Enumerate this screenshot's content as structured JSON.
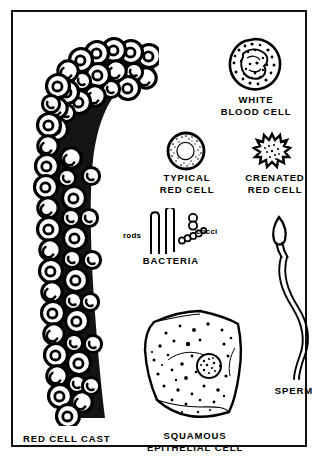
{
  "plate": {
    "title": "Urine sediment microscopy elements",
    "background_color": "#ffffff",
    "ink_color": "#000000",
    "frame_color": "#111111",
    "style": "black-and-white line drawing"
  },
  "specimens": [
    {
      "id": "red-cell-cast",
      "caption": "RED CELL CAST",
      "icon": "red-cell-cast-illustration",
      "position": "left column, full height, curving from upper right to lower left"
    },
    {
      "id": "white-blood-cell",
      "caption": "WHITE\nBLOOD CELL",
      "caption_lines": [
        "WHITE",
        "BLOOD CELL"
      ],
      "icon": "white-blood-cell-illustration",
      "position": "upper right"
    },
    {
      "id": "typical-red-cell",
      "caption": "TYPICAL\nRED CELL",
      "caption_lines": [
        "TYPICAL",
        "RED CELL"
      ],
      "icon": "typical-red-cell-illustration",
      "position": "middle center"
    },
    {
      "id": "crenated-red-cell",
      "caption": "CRENATED\nRED CELL",
      "caption_lines": [
        "CRENATED",
        "RED CELL"
      ],
      "icon": "crenated-red-cell-illustration",
      "position": "middle right"
    },
    {
      "id": "bacteria",
      "caption": "BACTERIA",
      "icon": "bacteria-illustration",
      "position": "center",
      "sub_labels": [
        {
          "id": "rods",
          "text": "rods"
        },
        {
          "id": "cocci",
          "text": "cocci"
        }
      ]
    },
    {
      "id": "sperm",
      "caption": "SPERM",
      "icon": "sperm-illustration",
      "position": "lower right"
    },
    {
      "id": "squamous-epithelial-cell",
      "caption": "SQUAMOUS\nEPITHELIAL CELL",
      "caption_lines": [
        "SQUAMOUS",
        "EPITHELIAL CELL"
      ],
      "icon": "squamous-epithelial-cell-illustration",
      "position": "lower center"
    }
  ]
}
